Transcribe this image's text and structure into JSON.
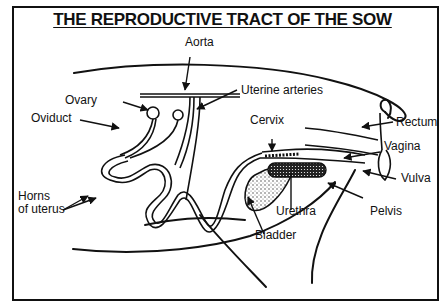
{
  "title": "THE REPRODUCTIVE TRACT OF THE SOW",
  "labels": {
    "aorta": "Aorta",
    "ovary": "Ovary",
    "oviduct": "Oviduct",
    "uterine_arteries": "Uterine arteries",
    "cervix": "Cervix",
    "rectum": "Rectum",
    "vagina": "Vagina",
    "vulva": "Vulva",
    "horns_line1": "Horns",
    "horns_line2": "of uterus",
    "urethra": "Urethra",
    "pelvis": "Pelvis",
    "bladder": "Bladder"
  },
  "colors": {
    "ink": "#111111",
    "background": "#ffffff"
  }
}
